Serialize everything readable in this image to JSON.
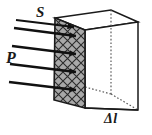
{
  "figure": {
    "type": "physics-diagram",
    "background_color": "#ffffff",
    "labels": {
      "area": "S",
      "pressure": "P",
      "length": "Δl"
    },
    "colors": {
      "stroke": "#1a1a1a",
      "hatch_fill": "#a8a8a8",
      "hatch_line": "#2a2a2a",
      "hidden_edge": "#5a5a5a",
      "arrow": "#111111",
      "text": "#1a1a1a"
    },
    "box": {
      "front_face": {
        "name": "hatched-front-face",
        "points": "55,18 85,30 85,108 54,100",
        "shaded": true
      },
      "top_face": {
        "name": "top-face",
        "points": "55,18 111,10 138,22 85,30"
      },
      "right_face": {
        "name": "right-face",
        "points": "85,30 138,22 138,110 85,108"
      },
      "hidden_edges": [
        {
          "name": "back-vertical-hidden-edge",
          "x1": 111,
          "y1": 10,
          "x2": 111,
          "y2": 94
        },
        {
          "name": "back-left-hidden-edge",
          "x1": 111,
          "y1": 94,
          "x2": 85,
          "y2": 87
        },
        {
          "name": "back-right-hidden-edge",
          "x1": 111,
          "y1": 94,
          "x2": 138,
          "y2": 110
        }
      ]
    },
    "arrows": [
      {
        "name": "pressure-arrow-1",
        "x1": 14,
        "y1": 31,
        "x2": 76,
        "y2": 39
      },
      {
        "name": "pressure-arrow-2",
        "x1": 11,
        "y1": 48,
        "x2": 76,
        "y2": 57
      },
      {
        "name": "pressure-arrow-3",
        "x1": 9,
        "y1": 66,
        "x2": 76,
        "y2": 74
      },
      {
        "name": "pressure-arrow-4",
        "x1": 8,
        "y1": 84,
        "x2": 76,
        "y2": 92
      },
      {
        "name": "pressure-arrow-5",
        "x1": 10,
        "y1": 28,
        "x2": 76,
        "y2": 28
      }
    ]
  }
}
